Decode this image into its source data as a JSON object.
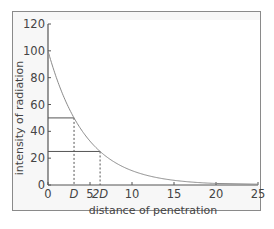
{
  "chart_data": {
    "type": "line",
    "title": "",
    "xlabel": "distance of penetration",
    "ylabel": "intensity of radiation",
    "xlim": [
      0,
      25
    ],
    "ylim": [
      0,
      120
    ],
    "x_ticks": [
      "0",
      "5",
      "10",
      "15",
      "20",
      "25"
    ],
    "y_ticks": [
      "0",
      "20",
      "40",
      "60",
      "80",
      "100",
      "120"
    ],
    "grid": false,
    "legend": null,
    "series": [
      {
        "name": "intensity",
        "description": "exponential decay, halving every distance D",
        "x": [
          0,
          1,
          2,
          3.1,
          4,
          5,
          6.2,
          8,
          10,
          12,
          15,
          18,
          20
        ],
        "y": [
          100,
          80,
          64,
          50,
          41,
          33,
          25,
          17,
          11,
          7,
          3.5,
          1.8,
          1.1
        ]
      }
    ],
    "annotations": [
      {
        "label": "D",
        "x": 3.1,
        "y": 50,
        "style": "solid horizontal from y-axis, dashed vertical to x-axis"
      },
      {
        "label": "2D",
        "x": 6.2,
        "y": 25,
        "style": "solid horizontal from y-axis, dashed vertical to x-axis"
      }
    ]
  },
  "labels": {
    "xlabel": "distance of penetration",
    "ylabel": "intensity of radiation",
    "d": "D",
    "two_d": "2D"
  },
  "colors": {
    "curve": "#8a8a8a",
    "axis": "#555555",
    "guide": "#555555",
    "frame_bg": "#f7f7f7",
    "plot_bg": "#ffffff"
  }
}
